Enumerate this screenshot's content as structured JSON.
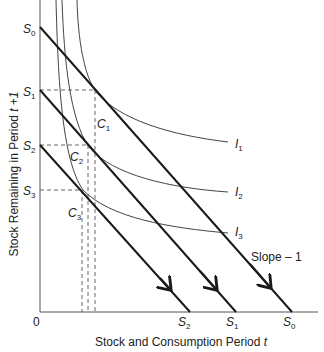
{
  "diagram": {
    "x_axis_label": "Stock and Consumption Period ",
    "x_axis_var": "t",
    "y_axis_label": "Stock Remaining in Period ",
    "y_axis_var": "t +1",
    "origin_label": "0",
    "y_ticks": [
      {
        "sym": "S",
        "sub": "0"
      },
      {
        "sym": "S",
        "sub": "1"
      },
      {
        "sym": "S",
        "sub": "2"
      },
      {
        "sym": "S",
        "sub": "3"
      }
    ],
    "x_ticks": [
      {
        "sym": "S",
        "sub": "2"
      },
      {
        "sym": "S",
        "sub": "1"
      },
      {
        "sym": "S",
        "sub": "0"
      }
    ],
    "consumption_labels": [
      {
        "sym": "C",
        "sub": "1"
      },
      {
        "sym": "C",
        "sub": "2"
      },
      {
        "sym": "C",
        "sub": "3"
      }
    ],
    "indifference_curves": [
      {
        "sym": "I",
        "sub": "1"
      },
      {
        "sym": "I",
        "sub": "2"
      },
      {
        "sym": "I",
        "sub": "3"
      }
    ],
    "slope_label": "Slope – 1",
    "line_color": "#1a1a1a",
    "curve_color": "#444444"
  }
}
